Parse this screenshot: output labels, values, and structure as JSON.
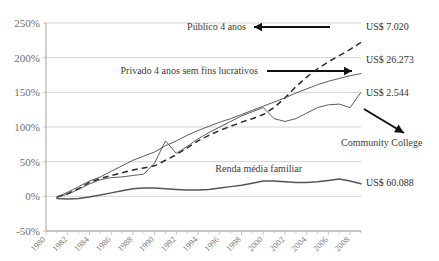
{
  "chart_data": {
    "type": "line",
    "title": "",
    "subtitle": "",
    "xlabel": "",
    "ylabel": "",
    "xlim": [
      1980,
      2009
    ],
    "ylim": [
      -50,
      250
    ],
    "grid": true,
    "legend_position": "inline-annotations",
    "ytick_labels": [
      "250%",
      "200%",
      "150%",
      "100%",
      "50%",
      "0%",
      "-50%"
    ],
    "ytick_values": [
      250,
      200,
      150,
      100,
      50,
      0,
      -50
    ],
    "xtick_labels": [
      "1980",
      "1982",
      "1984",
      "1986",
      "1988",
      "1990",
      "1992",
      "1994",
      "1996",
      "1998",
      "2000",
      "2002",
      "2004",
      "2006",
      "2008"
    ],
    "xtick_values": [
      1980,
      1982,
      1984,
      1986,
      1988,
      1990,
      1992,
      1994,
      1996,
      1998,
      2000,
      2002,
      2004,
      2006,
      2008
    ],
    "x": [
      1981,
      1982,
      1983,
      1984,
      1985,
      1986,
      1987,
      1988,
      1989,
      1990,
      1991,
      1992,
      1993,
      1994,
      1995,
      1996,
      1997,
      1998,
      1999,
      2000,
      2001,
      2002,
      2003,
      2004,
      2005,
      2006,
      2007,
      2008,
      2009
    ],
    "series": [
      {
        "name": "Público 4 anos",
        "style": "dashed",
        "end_label": "US$ 7.020",
        "values": [
          -1,
          4,
          11,
          20,
          26,
          30,
          34,
          38,
          41,
          44,
          52,
          60,
          70,
          80,
          88,
          95,
          101,
          107,
          112,
          118,
          128,
          142,
          158,
          172,
          184,
          194,
          203,
          212,
          222
        ]
      },
      {
        "name": "Privado 4 anos sem fins lucrativos",
        "style": "thin",
        "end_label": "US$ 26.273",
        "values": [
          -1,
          6,
          14,
          22,
          28,
          36,
          44,
          52,
          58,
          64,
          73,
          80,
          88,
          95,
          101,
          107,
          112,
          118,
          124,
          130,
          136,
          142,
          149,
          155,
          161,
          166,
          170,
          174,
          177
        ]
      },
      {
        "name": "Community College",
        "style": "thin",
        "end_label": "US$ 2.544",
        "values": [
          -1,
          3,
          10,
          18,
          24,
          27,
          28,
          30,
          32,
          48,
          80,
          62,
          72,
          83,
          92,
          100,
          108,
          116,
          122,
          128,
          112,
          108,
          112,
          120,
          128,
          132,
          133,
          128,
          150
        ]
      },
      {
        "name": "Renda média familiar",
        "style": "thick",
        "end_label": "US$ 60.088",
        "values": [
          -3,
          -4,
          -3,
          -1,
          2,
          5,
          8,
          11,
          12,
          12,
          11,
          10,
          9,
          9,
          10,
          12,
          14,
          16,
          19,
          22,
          22,
          21,
          20,
          20,
          21,
          23,
          25,
          22,
          18
        ]
      }
    ],
    "annotations": [
      {
        "text": "Público 4 anos",
        "arrow": "left"
      },
      {
        "text": "Privado 4 anos sem fins lucrativos",
        "arrow": "right"
      },
      {
        "text": "Renda média familiar",
        "arrow": "none"
      },
      {
        "text": "Community College",
        "arrow": "diagonal-down-right"
      }
    ],
    "right_labels": [
      "US$ 7.020",
      "US$ 26.273",
      "US$ 2.544",
      "US$ 60.088"
    ],
    "colors": {
      "grid": "#c8c8c8",
      "axis": "#9a9a9a",
      "series_thin": "#4a4a4a",
      "series_dashed": "#2b2b2b",
      "series_thick": "#555555",
      "arrow": "#111111",
      "tick_text": "#6e6e6e",
      "annotation_text": "#3d3d3d"
    }
  }
}
